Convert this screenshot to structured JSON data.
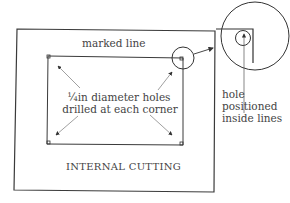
{
  "diagram": {
    "title": "INTERNAL CUTTING",
    "labels": {
      "marked_line": "marked line",
      "holes_line1": "¼in diameter holes",
      "holes_line2": "drilled at each corner",
      "hole_line1": "hole",
      "hole_line2": "positioned",
      "hole_line3": "inside lines",
      "caption": "INTERNAL CUTTING"
    },
    "elements": {
      "outer_rect": "workpiece outline",
      "inner_rect": "marked line rectangle",
      "corner_holes": 4,
      "detail_circle": "enlarged corner detail"
    },
    "colors": {
      "line": "#3a3a3a",
      "background": "#ffffff"
    }
  }
}
